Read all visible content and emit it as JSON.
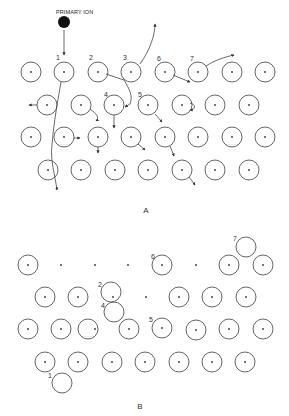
{
  "colors": {
    "ink": "#444444",
    "ion": "#111111",
    "background": "#ffffff"
  },
  "atom_radius": 10,
  "panel_a": {
    "caption": "A",
    "primary_ion_label": "PRIMARY ION",
    "primary_ion": {
      "x": 64,
      "y": 22,
      "r": 6
    },
    "rows": [
      {
        "y": 72,
        "xs": [
          31,
          64,
          98,
          131,
          165,
          198,
          232,
          265
        ]
      },
      {
        "y": 105,
        "xs": [
          47,
          81,
          114,
          148,
          182,
          215,
          249
        ]
      },
      {
        "y": 137,
        "xs": [
          31,
          64,
          98,
          131,
          165,
          198,
          232,
          265
        ]
      },
      {
        "y": 170,
        "xs": [
          48,
          81,
          115,
          148,
          182,
          215,
          249
        ]
      }
    ],
    "labels": [
      {
        "text": "1",
        "x": 56,
        "y": 60
      },
      {
        "text": "2",
        "x": 89,
        "y": 60
      },
      {
        "text": "3",
        "x": 123,
        "y": 60
      },
      {
        "text": "6",
        "x": 157,
        "y": 61
      },
      {
        "text": "7",
        "x": 190,
        "y": 61
      },
      {
        "text": "4",
        "x": 104,
        "y": 97
      },
      {
        "text": "5",
        "x": 138,
        "y": 97
      }
    ],
    "trajectories": [
      "M64 30 L64 55",
      "M61 82 C58 100 54 120 52 145 C50 160 55 175 57 190",
      "M37 105 L29 105",
      "M106 74 L124 80 C130 90 133 96 130 104 L125 107",
      "M140 64 C150 50 155 35 155 24",
      "M206 66 C215 60 225 57 234 55",
      "M173 75 L190 82",
      "M90 109 C96 113 100 118 96 121",
      "M114 115 L114 128",
      "M155 114 L162 122",
      "M190 103 C196 104 196 110 190 110",
      "M74 138 L80 138",
      "M98 147 L98 153",
      "M138 144 L145 150",
      "M170 146 L174 156",
      "M189 177 L195 185"
    ]
  },
  "panel_b": {
    "caption": "B",
    "atoms": [
      {
        "x": 28,
        "y": 265,
        "dot": true
      },
      {
        "x": 162,
        "y": 265,
        "dot": true
      },
      {
        "x": 229,
        "y": 265,
        "dot": true
      },
      {
        "x": 263,
        "y": 265,
        "dot": true
      },
      {
        "x": 246,
        "y": 247,
        "dot": false
      },
      {
        "x": 45,
        "y": 297,
        "dot": true
      },
      {
        "x": 78,
        "y": 297,
        "dot": true
      },
      {
        "x": 111,
        "y": 292,
        "dot": false
      },
      {
        "x": 179,
        "y": 297,
        "dot": true
      },
      {
        "x": 212,
        "y": 297,
        "dot": true
      },
      {
        "x": 246,
        "y": 297,
        "dot": true
      },
      {
        "x": 114,
        "y": 312,
        "dot": false
      },
      {
        "x": 28,
        "y": 329,
        "dot": true
      },
      {
        "x": 61,
        "y": 329,
        "dot": true
      },
      {
        "x": 88,
        "y": 329,
        "dot": false
      },
      {
        "x": 129,
        "y": 329,
        "dot": true
      },
      {
        "x": 162,
        "y": 328,
        "dot": true
      },
      {
        "x": 196,
        "y": 330,
        "dot": true
      },
      {
        "x": 229,
        "y": 329,
        "dot": true
      },
      {
        "x": 263,
        "y": 329,
        "dot": true
      },
      {
        "x": 45,
        "y": 362,
        "dot": true
      },
      {
        "x": 78,
        "y": 362,
        "dot": true
      },
      {
        "x": 112,
        "y": 362,
        "dot": true
      },
      {
        "x": 145,
        "y": 362,
        "dot": true
      },
      {
        "x": 179,
        "y": 362,
        "dot": true
      },
      {
        "x": 212,
        "y": 362,
        "dot": true
      },
      {
        "x": 245,
        "y": 362,
        "dot": true
      },
      {
        "x": 62,
        "y": 383,
        "dot": false
      }
    ],
    "vacancy_dots": [
      {
        "x": 61,
        "y": 265
      },
      {
        "x": 95,
        "y": 265
      },
      {
        "x": 128,
        "y": 265
      },
      {
        "x": 196,
        "y": 265
      },
      {
        "x": 113,
        "y": 297
      },
      {
        "x": 146,
        "y": 297
      },
      {
        "x": 95,
        "y": 329
      }
    ],
    "labels": [
      {
        "text": "7",
        "x": 233,
        "y": 241
      },
      {
        "text": "6",
        "x": 151,
        "y": 259
      },
      {
        "text": "2",
        "x": 98,
        "y": 287
      },
      {
        "text": "4",
        "x": 101,
        "y": 308
      },
      {
        "text": "5",
        "x": 149,
        "y": 322
      },
      {
        "text": "1",
        "x": 48,
        "y": 378
      }
    ]
  }
}
